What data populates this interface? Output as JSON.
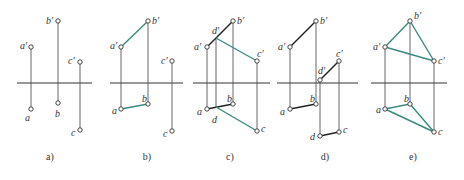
{
  "figure": {
    "colors": {
      "background": "#ffffff",
      "axis": "#333333",
      "projector": "#555555",
      "black_segment": "#222222",
      "teal_segment": "#3a8a80",
      "point_stroke": "#333333",
      "label": "#333333"
    },
    "panels": [
      {
        "id": "a",
        "caption": "a)",
        "caption_pos": [
          50,
          160
        ],
        "axis": [
          17,
          92,
          83
        ],
        "points": [
          {
            "name": "a'",
            "label": "a′",
            "xy": [
              31,
              47
            ],
            "label_pos": [
              20,
              49
            ]
          },
          {
            "name": "b'",
            "label": "b′",
            "xy": [
              58,
              21
            ],
            "label_pos": [
              46,
              24
            ]
          },
          {
            "name": "c'",
            "label": "c′",
            "xy": [
              80,
              62
            ],
            "label_pos": [
              68,
              64
            ]
          },
          {
            "name": "a",
            "label": "a",
            "xy": [
              31,
              109
            ],
            "label_pos": [
              25,
              121
            ]
          },
          {
            "name": "b",
            "label": "b",
            "xy": [
              58,
              103
            ],
            "label_pos": [
              55,
              117
            ]
          },
          {
            "name": "c",
            "label": "c",
            "xy": [
              80,
              130
            ],
            "label_pos": [
              71,
              136
            ]
          }
        ],
        "projectors": [
          [
            [
              31,
              47
            ],
            [
              31,
              109
            ]
          ],
          [
            [
              58,
              21
            ],
            [
              58,
              103
            ]
          ],
          [
            [
              80,
              62
            ],
            [
              80,
              130
            ]
          ]
        ],
        "segments": []
      },
      {
        "id": "b",
        "caption": "b)",
        "caption_pos": [
          147,
          160
        ],
        "axis": [
          110,
          183,
          83
        ],
        "points": [
          {
            "name": "a'",
            "label": "a′",
            "xy": [
              121,
              47
            ],
            "label_pos": [
              110,
              49
            ]
          },
          {
            "name": "b'",
            "label": "b′",
            "xy": [
              148,
              21
            ],
            "label_pos": [
              152,
              24
            ]
          },
          {
            "name": "c'",
            "label": "c′",
            "xy": [
              172,
              61
            ],
            "label_pos": [
              161,
              64
            ]
          },
          {
            "name": "a",
            "label": "a",
            "xy": [
              121,
              109
            ],
            "label_pos": [
              112,
              114
            ]
          },
          {
            "name": "b",
            "label": "b",
            "xy": [
              148,
              104
            ],
            "label_pos": [
              142,
              102
            ]
          },
          {
            "name": "c",
            "label": "c",
            "xy": [
              172,
              131
            ],
            "label_pos": [
              163,
              137
            ]
          }
        ],
        "projectors": [
          [
            [
              121,
              47
            ],
            [
              121,
              109
            ]
          ],
          [
            [
              148,
              21
            ],
            [
              148,
              104
            ]
          ],
          [
            [
              172,
              61
            ],
            [
              172,
              131
            ]
          ]
        ],
        "segments": [
          {
            "from": [
              121,
              47
            ],
            "to": [
              148,
              21
            ],
            "color": "teal"
          },
          {
            "from": [
              121,
              109
            ],
            "to": [
              148,
              104
            ],
            "color": "teal"
          }
        ]
      },
      {
        "id": "c",
        "caption": "c)",
        "caption_pos": [
          230,
          160
        ],
        "axis": [
          193,
          270,
          83
        ],
        "points": [
          {
            "name": "a'",
            "label": "a′",
            "xy": [
              207,
              47
            ],
            "label_pos": [
              194,
              50
            ],
            "circle": true
          },
          {
            "name": "d'",
            "label": "d′",
            "xy": [
              216,
              38
            ],
            "label_pos": [
              212,
              34
            ],
            "circle": false
          },
          {
            "name": "b'",
            "label": "b′",
            "xy": [
              233,
              21
            ],
            "label_pos": [
              237,
              24
            ],
            "circle": true
          },
          {
            "name": "c'",
            "label": "c′",
            "xy": [
              257,
              61
            ],
            "label_pos": [
              257,
              57
            ],
            "circle": true
          },
          {
            "name": "a",
            "label": "a",
            "xy": [
              207,
              109
            ],
            "label_pos": [
              197,
              115
            ],
            "circle": true
          },
          {
            "name": "d",
            "label": "d",
            "xy": [
              216,
              107
            ],
            "label_pos": [
              212,
              123
            ],
            "circle": false
          },
          {
            "name": "b",
            "label": "b",
            "xy": [
              233,
              104
            ],
            "label_pos": [
              227,
              102
            ],
            "circle": true
          },
          {
            "name": "c",
            "label": "c",
            "xy": [
              257,
              131
            ],
            "label_pos": [
              261,
              132
            ],
            "circle": true
          }
        ],
        "projectors": [
          [
            [
              207,
              47
            ],
            [
              207,
              109
            ]
          ],
          [
            [
              216,
              38
            ],
            [
              216,
              107
            ]
          ],
          [
            [
              233,
              21
            ],
            [
              233,
              104
            ]
          ],
          [
            [
              257,
              61
            ],
            [
              257,
              131
            ]
          ]
        ],
        "segments": [
          {
            "from": [
              207,
              47
            ],
            "to": [
              233,
              21
            ],
            "color": "black"
          },
          {
            "from": [
              216,
              38
            ],
            "to": [
              257,
              61
            ],
            "color": "teal"
          },
          {
            "from": [
              207,
              109
            ],
            "to": [
              233,
              104
            ],
            "color": "black"
          },
          {
            "from": [
              216,
              107
            ],
            "to": [
              257,
              131
            ],
            "color": "teal"
          }
        ]
      },
      {
        "id": "d",
        "caption": "d)",
        "caption_pos": [
          325,
          160
        ],
        "axis": [
          277,
          358,
          83
        ],
        "points": [
          {
            "name": "a'",
            "label": "a′",
            "xy": [
              290,
              47
            ],
            "label_pos": [
              278,
              50
            ]
          },
          {
            "name": "b'",
            "label": "b′",
            "xy": [
              316,
              21
            ],
            "label_pos": [
              320,
              24
            ]
          },
          {
            "name": "c'",
            "label": "c′",
            "xy": [
              339,
              61
            ],
            "label_pos": [
              336,
              57
            ]
          },
          {
            "name": "d'",
            "label": "d′",
            "xy": [
              320,
              80
            ],
            "label_pos": [
              318,
              74
            ]
          },
          {
            "name": "a",
            "label": "a",
            "xy": [
              290,
              109
            ],
            "label_pos": [
              280,
              115
            ]
          },
          {
            "name": "b",
            "label": "b",
            "xy": [
              316,
              104
            ],
            "label_pos": [
              310,
              102
            ]
          },
          {
            "name": "d",
            "label": "d",
            "xy": [
              320,
              136
            ],
            "label_pos": [
              310,
              140
            ]
          },
          {
            "name": "c",
            "label": "c",
            "xy": [
              339,
              132
            ],
            "label_pos": [
              343,
              133
            ]
          }
        ],
        "projectors": [
          [
            [
              290,
              47
            ],
            [
              290,
              109
            ]
          ],
          [
            [
              316,
              21
            ],
            [
              316,
              104
            ]
          ],
          [
            [
              320,
              80
            ],
            [
              320,
              136
            ]
          ],
          [
            [
              339,
              61
            ],
            [
              339,
              132
            ]
          ]
        ],
        "segments": [
          {
            "from": [
              290,
              47
            ],
            "to": [
              316,
              21
            ],
            "color": "black"
          },
          {
            "from": [
              290,
              109
            ],
            "to": [
              316,
              104
            ],
            "color": "black"
          },
          {
            "from": [
              320,
              80
            ],
            "to": [
              339,
              61
            ],
            "color": "black"
          },
          {
            "from": [
              320,
              136
            ],
            "to": [
              339,
              132
            ],
            "color": "black"
          }
        ]
      },
      {
        "id": "e",
        "caption": "e)",
        "caption_pos": [
          413,
          160
        ],
        "axis": [
          371,
          447,
          83
        ],
        "points": [
          {
            "name": "a'",
            "label": "a′",
            "xy": [
              385,
              47
            ],
            "label_pos": [
              373,
              50
            ]
          },
          {
            "name": "b'",
            "label": "b′",
            "xy": [
              410,
              21
            ],
            "label_pos": [
              414,
              19
            ]
          },
          {
            "name": "c'",
            "label": "c′",
            "xy": [
              434,
              61
            ],
            "label_pos": [
              438,
              64
            ]
          },
          {
            "name": "a",
            "label": "a",
            "xy": [
              385,
              109
            ],
            "label_pos": [
              376,
              113
            ]
          },
          {
            "name": "b",
            "label": "b",
            "xy": [
              410,
              104
            ],
            "label_pos": [
              404,
              102
            ]
          },
          {
            "name": "c",
            "label": "c",
            "xy": [
              434,
              132
            ],
            "label_pos": [
              438,
              135
            ]
          }
        ],
        "projectors": [
          [
            [
              385,
              47
            ],
            [
              385,
              109
            ]
          ],
          [
            [
              410,
              21
            ],
            [
              410,
              104
            ]
          ],
          [
            [
              434,
              61
            ],
            [
              434,
              132
            ]
          ]
        ],
        "segments": [
          {
            "from": [
              385,
              47
            ],
            "to": [
              410,
              21
            ],
            "color": "teal"
          },
          {
            "from": [
              410,
              21
            ],
            "to": [
              434,
              61
            ],
            "color": "teal"
          },
          {
            "from": [
              385,
              47
            ],
            "to": [
              434,
              61
            ],
            "color": "teal"
          },
          {
            "from": [
              385,
              109
            ],
            "to": [
              410,
              104
            ],
            "color": "teal"
          },
          {
            "from": [
              410,
              104
            ],
            "to": [
              434,
              132
            ],
            "color": "teal"
          },
          {
            "from": [
              385,
              109
            ],
            "to": [
              434,
              132
            ],
            "color": "teal"
          }
        ]
      }
    ]
  }
}
